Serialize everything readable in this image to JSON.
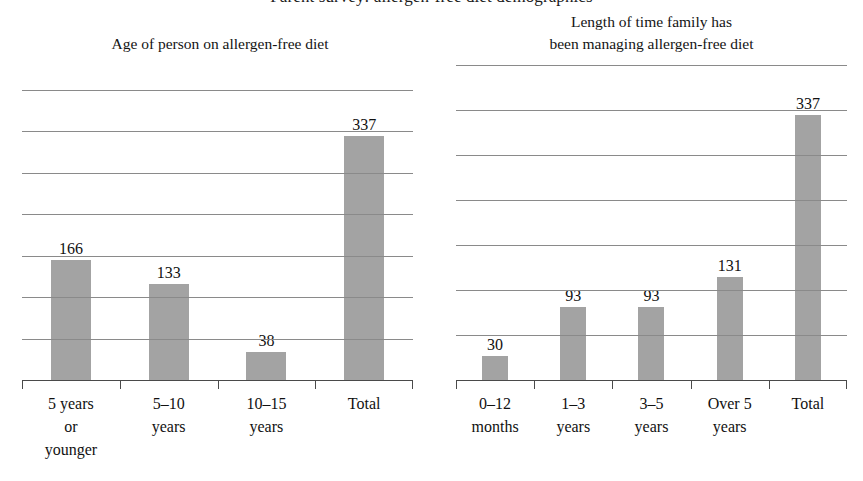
{
  "supertitle": "Parent survey: allergen-free diet demographics",
  "theme": {
    "bar_color": "#a3a3a3",
    "gridline_color": "#8a8a8a",
    "axis_color": "#4a4a4a",
    "text_color": "#111111",
    "background": "#ffffff"
  },
  "charts": [
    {
      "id": "age-chart",
      "title": "Age of person on allergen-free diet",
      "categories": [
        "5 years\nor\nyounger",
        "5–10\nyears",
        "10–15\nyears",
        "Total"
      ],
      "values": [
        166,
        133,
        38,
        337
      ],
      "value_labels": [
        "166",
        "133",
        "38",
        "337"
      ],
      "gridline_count": 8,
      "ymax": 400
    },
    {
      "id": "duration-chart",
      "title": "Length of time family has\nbeen managing allergen-free diet",
      "categories": [
        "0–12\nmonths",
        "1–3\nyears",
        "3–5\nyears",
        "Over 5\nyears",
        "Total"
      ],
      "values": [
        30,
        93,
        93,
        131,
        337
      ],
      "value_labels": [
        "30",
        "93",
        "93",
        "131",
        "337"
      ],
      "gridline_count": 8,
      "ymax": 400
    }
  ],
  "chart_data": [
    {
      "type": "bar",
      "title": "Age of person on allergen-free diet",
      "categories": [
        "5 years or younger",
        "5–10 years",
        "10–15 years",
        "Total"
      ],
      "values": [
        166,
        133,
        38,
        337
      ],
      "xlabel": "",
      "ylabel": "",
      "ylim": [
        0,
        400
      ],
      "grid": true,
      "legend": "none",
      "data_labels": true,
      "series_color": "#a3a3a3"
    },
    {
      "type": "bar",
      "title": "Length of time family has been managing allergen-free diet",
      "categories": [
        "0–12 months",
        "1–3 years",
        "3–5 years",
        "Over 5 years",
        "Total"
      ],
      "values": [
        30,
        93,
        93,
        131,
        337
      ],
      "xlabel": "",
      "ylabel": "",
      "ylim": [
        0,
        400
      ],
      "grid": true,
      "legend": "none",
      "data_labels": true,
      "series_color": "#a3a3a3"
    }
  ]
}
